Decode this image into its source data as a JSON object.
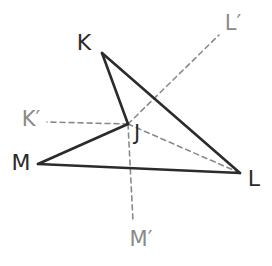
{
  "figure": {
    "background_color": "#ffffff",
    "solid_stroke_color": "#2b2b2b",
    "dashed_stroke_color": "#8a8a8a",
    "label_color": "#2b2b2b",
    "image_label_color": "#8a8a8a"
  },
  "points": {
    "K": {
      "label": "K",
      "x": 102,
      "y": 53,
      "label_x": 84,
      "label_y": 44
    },
    "L": {
      "label": "L",
      "x": 240,
      "y": 173,
      "label_x": 254,
      "label_y": 180
    },
    "M": {
      "label": "M",
      "x": 38,
      "y": 164,
      "label_x": 21,
      "label_y": 164
    },
    "J": {
      "label": "J",
      "x": 128,
      "y": 124,
      "label_x": 137,
      "label_y": 134
    },
    "Kp": {
      "label": "K′",
      "x": 47,
      "y": 122,
      "label_x": 31,
      "label_y": 120
    },
    "Lp": {
      "label": "L′",
      "x": 219,
      "y": 35,
      "label_x": 233,
      "label_y": 24
    },
    "Mp": {
      "label": "M′",
      "x": 133,
      "y": 221,
      "label_x": 141,
      "label_y": 240
    }
  },
  "solid_segments": [
    {
      "name": "segment-K-J",
      "from": "K",
      "to": "J"
    },
    {
      "name": "segment-K-L",
      "from": "K",
      "to": "L"
    },
    {
      "name": "segment-M-J",
      "from": "M",
      "to": "J"
    },
    {
      "name": "segment-M-L",
      "from": "M",
      "to": "L"
    }
  ],
  "dashed_segments": [
    {
      "name": "ray-J-to-Kprime",
      "from": "J",
      "to": "Kp"
    },
    {
      "name": "ray-J-to-Lprime",
      "from": "J",
      "to": "Lp"
    },
    {
      "name": "ray-J-to-Mprime",
      "from": "J",
      "to": "Mp"
    },
    {
      "name": "segment-J-L-dashed",
      "from": "J",
      "to": "L"
    }
  ],
  "labels": {
    "K": "K",
    "L": "L",
    "M": "M",
    "J": "J",
    "K_prime": "K′",
    "L_prime": "L′",
    "M_prime": "M′"
  }
}
